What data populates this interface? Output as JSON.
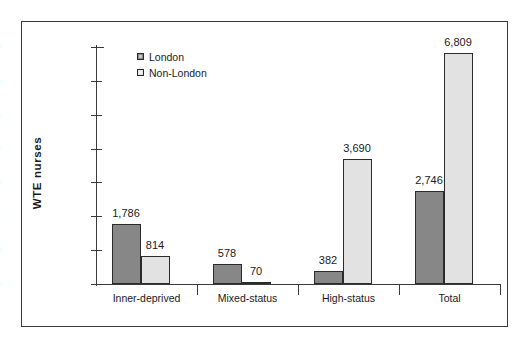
{
  "chart_data": {
    "type": "bar",
    "title": "",
    "subtitle": "",
    "xlabel": "",
    "ylabel": "WTE  nurses",
    "categories": [
      "Inner-deprived",
      "Mixed-status",
      "High-status",
      "Total"
    ],
    "series": [
      {
        "name": "London",
        "color": "#878787",
        "values": [
          1786,
          578,
          382,
          2746
        ],
        "labels": [
          "1,786",
          "578",
          "382",
          "2,746"
        ]
      },
      {
        "name": "Non-London",
        "color": "#e2e2e2",
        "values": [
          814,
          70,
          3690,
          6809
        ],
        "labels": [
          "814",
          "70",
          "3,690",
          "6,809"
        ]
      }
    ],
    "ylim": [
      0,
      7000
    ],
    "ytick_values": [
      0,
      1000,
      2000,
      3000,
      4000,
      5000,
      6000,
      7000
    ],
    "ytick_labels": [
      "0",
      "1,000",
      "2,000",
      "3,000",
      "4,000",
      "5,000",
      "6,000",
      "7,000"
    ],
    "grid": false,
    "legend_position": "top-left",
    "legend_entries": [
      "London",
      "Non-London"
    ]
  },
  "axis": {
    "y_title": "WTE  nurses"
  },
  "legend": {
    "items": [
      {
        "label": "London"
      },
      {
        "label": "Non-London"
      }
    ]
  }
}
